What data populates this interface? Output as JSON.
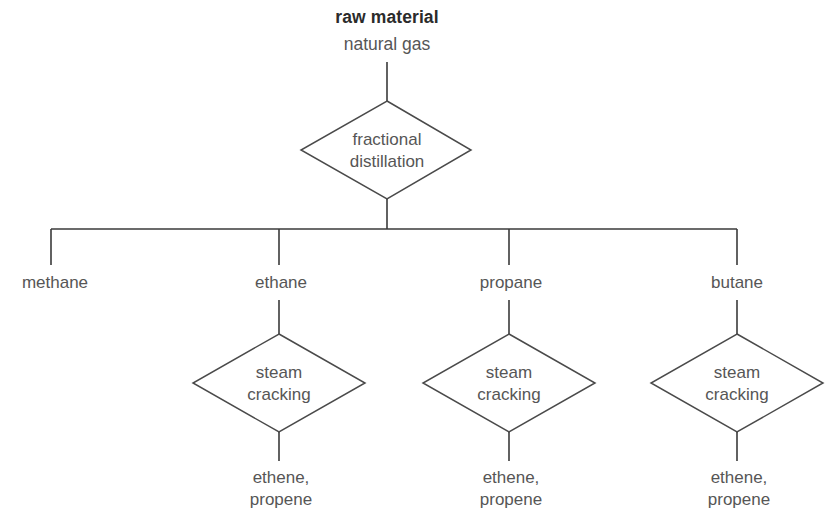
{
  "diagram": {
    "title_label": "raw material",
    "source_label": "natural gas",
    "process_top": {
      "line1": "fractional",
      "line2": "distillation"
    },
    "fractions": [
      {
        "label": "methane"
      },
      {
        "label": "ethane"
      },
      {
        "label": "propane"
      },
      {
        "label": "butane"
      }
    ],
    "crackers": [
      {
        "process_line1": "steam",
        "process_line2": "cracking",
        "output_line1": "ethene,",
        "output_line2": "propene"
      },
      {
        "process_line1": "steam",
        "process_line2": "cracking",
        "output_line1": "ethene,",
        "output_line2": "propene"
      },
      {
        "process_line1": "steam",
        "process_line2": "cracking",
        "output_line1": "ethene,",
        "output_line2": "propene"
      }
    ],
    "colors": {
      "background": "#ffffff",
      "line": "#3a3a3a",
      "shape_stroke": "#4a4a4a",
      "text": "#565656",
      "title_text": "#2b2b2b"
    }
  }
}
